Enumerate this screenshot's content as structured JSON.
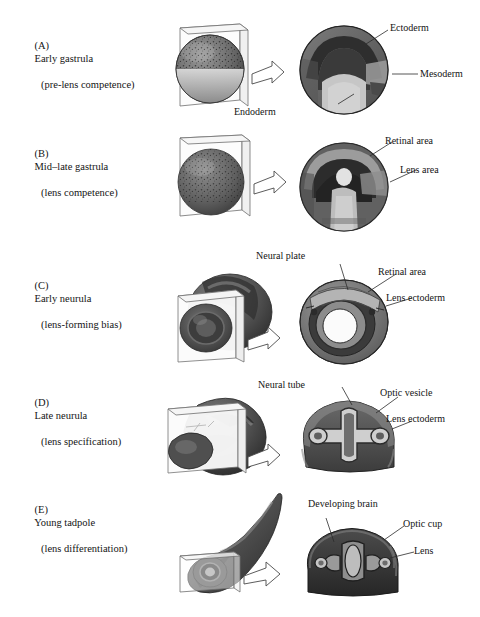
{
  "figure": {
    "type": "developmental-biology-diagram",
    "panel_count": 5
  },
  "panels": [
    {
      "id": "A",
      "tag": "(A)",
      "title": "Early gastrula",
      "subtitle": "(pre-lens competence)",
      "whole_embryo": "spherical gastrula with pigmented animal cap and pale vegetal region, intersected by a sectioning plane",
      "section_view": "sagittal section of spherical gastrula showing three germ layers",
      "labels": [
        {
          "text": "Ectoderm"
        },
        {
          "text": "Mesoderm"
        },
        {
          "text": "Endoderm"
        }
      ]
    },
    {
      "id": "B",
      "tag": "(B)",
      "title": "Mid–late gastrula",
      "subtitle": "(lens competence)",
      "whole_embryo": "spherical late gastrula with mottled pigmented surface and sectioning plane",
      "section_view": "section of late gastrula showing archenteron and presumptive eye regions",
      "labels": [
        {
          "text": "Retinal area"
        },
        {
          "text": "Lens area"
        }
      ]
    },
    {
      "id": "C",
      "tag": "(C)",
      "title": "Early neurula",
      "subtitle": "(lens-forming bias)",
      "whole_embryo": "ovoid early neurula embryo with neural folds, cut by a sectioning plane",
      "section_view": "transverse section ring showing neural plate and surrounding ectoderm",
      "labels": [
        {
          "text": "Neural plate"
        },
        {
          "text": "Retinal area"
        },
        {
          "text": "Lens ectoderm"
        }
      ]
    },
    {
      "id": "D",
      "tag": "(D)",
      "title": "Late neurula",
      "subtitle": "(lens specification)",
      "whole_embryo": "late neurula embryo with closed neural tube and sectioning plane",
      "section_view": "transverse section showing neural tube flanked by paired optic vesicles",
      "labels": [
        {
          "text": "Neural tube"
        },
        {
          "text": "Optic vesicle"
        },
        {
          "text": "Lens ectoderm"
        }
      ]
    },
    {
      "id": "E",
      "tag": "(E)",
      "title": "Young tadpole",
      "subtitle": "(lens differentiation)",
      "whole_embryo": "young tadpole with elongated tail and visible eye, head cut by a sectioning plane",
      "section_view": "transverse head section showing brain, optic cups and lenses",
      "labels": [
        {
          "text": "Developing brain"
        },
        {
          "text": "Optic cup"
        },
        {
          "text": "Lens"
        }
      ]
    }
  ],
  "style": {
    "background": "#ffffff",
    "text_color": "#141414",
    "leader_line_color": "#2b2b2b",
    "tissue_dark": "#4a4a4a",
    "tissue_mid": "#8a8a8a",
    "tissue_light": "#c9c9c9",
    "plane_fill": "#fbfbfb"
  }
}
